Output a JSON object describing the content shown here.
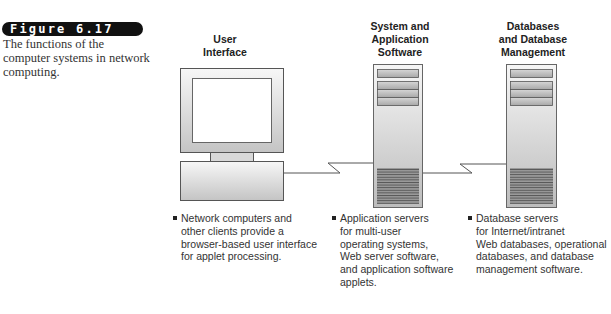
{
  "figure": {
    "label": "Figure 6.17",
    "caption": "The functions of the computer systems in network computing."
  },
  "columns": [
    {
      "title_lines": [
        "User",
        "Interface"
      ],
      "device": "computer-monitor",
      "bullet": "Network computers and\nother clients provide a\nbrowser-based user interface\nfor applet processing."
    },
    {
      "title_lines": [
        "System and",
        "Application",
        "Software"
      ],
      "device": "server-tower",
      "bullet": "Application servers\nfor multi-user\noperating systems,\nWeb server software,\nand application software\napplets."
    },
    {
      "title_lines": [
        "Databases",
        "and Database",
        "Management"
      ],
      "device": "server-tower",
      "bullet": "Database servers\nfor Internet/intranet\nWeb databases, operational\ndatabases, and database\nmanagement software."
    }
  ],
  "connections": [
    {
      "from": "User Interface",
      "to": "System and Application Software"
    },
    {
      "from": "System and Application Software",
      "to": "Databases and Database Management"
    }
  ],
  "colors": {
    "badge_bg": "#111111",
    "device_fill_light": "#f4f4f4",
    "device_fill_dark": "#bdbdbd",
    "outline": "#555555"
  }
}
